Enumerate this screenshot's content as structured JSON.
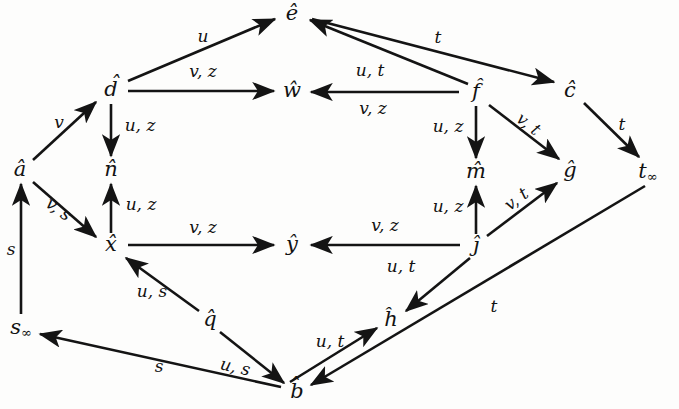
{
  "diagram": {
    "kind": "directed-graph",
    "title": "",
    "width": 679,
    "height": 409,
    "background_color": "#fdfdfc",
    "ink_color": "#141414",
    "nodes": [
      {
        "id": "e",
        "label": "ê",
        "base": "e",
        "accent": "hat",
        "sub": "",
        "x": 292,
        "y": 14
      },
      {
        "id": "d",
        "label": "d̂",
        "base": "d",
        "accent": "hat",
        "sub": "",
        "x": 111,
        "y": 90
      },
      {
        "id": "w",
        "label": "ŵ",
        "base": "w",
        "accent": "hat",
        "sub": "",
        "x": 292,
        "y": 91
      },
      {
        "id": "f",
        "label": "f̂",
        "base": "f",
        "accent": "hat",
        "sub": "",
        "x": 476,
        "y": 92
      },
      {
        "id": "c",
        "label": "ĉ",
        "base": "c",
        "accent": "hat",
        "sub": "",
        "x": 570,
        "y": 91
      },
      {
        "id": "a",
        "label": "â",
        "base": "a",
        "accent": "hat",
        "sub": "",
        "x": 20,
        "y": 170
      },
      {
        "id": "n",
        "label": "n̂",
        "base": "n",
        "accent": "hat",
        "sub": "",
        "x": 111,
        "y": 170
      },
      {
        "id": "m",
        "label": "m̂",
        "base": "m",
        "accent": "hat",
        "sub": "",
        "x": 476,
        "y": 172
      },
      {
        "id": "g",
        "label": "ĝ",
        "base": "g",
        "accent": "hat",
        "sub": "",
        "x": 570,
        "y": 171
      },
      {
        "id": "tinf",
        "label": "t∞",
        "base": "t",
        "accent": "none",
        "sub": "∞",
        "x": 648,
        "y": 172
      },
      {
        "id": "x",
        "label": "x̂",
        "base": "x",
        "accent": "hat",
        "sub": "",
        "x": 111,
        "y": 245
      },
      {
        "id": "y",
        "label": "ŷ",
        "base": "y",
        "accent": "hat",
        "sub": "",
        "x": 292,
        "y": 245
      },
      {
        "id": "j",
        "label": "ĵ",
        "base": "j",
        "accent": "hat",
        "sub": "",
        "x": 476,
        "y": 246
      },
      {
        "id": "q",
        "label": "q̂",
        "base": "q",
        "accent": "hat",
        "sub": "",
        "x": 210,
        "y": 320
      },
      {
        "id": "h",
        "label": "ĥ",
        "base": "h",
        "accent": "hat",
        "sub": "",
        "x": 391,
        "y": 320
      },
      {
        "id": "sinf",
        "label": "s∞",
        "base": "s",
        "accent": "none",
        "sub": "∞",
        "x": 21,
        "y": 328
      },
      {
        "id": "b",
        "label": "b̂",
        "base": "b",
        "accent": "hat",
        "sub": "",
        "x": 297,
        "y": 392
      }
    ],
    "edges": [
      {
        "id": "d-e",
        "from": "d",
        "to": "e",
        "label": "u",
        "lx": 203,
        "ly": 37
      },
      {
        "id": "d-w",
        "from": "d",
        "to": "w",
        "label": "v, z",
        "lx": 203,
        "ly": 72
      },
      {
        "id": "d-n",
        "from": "d",
        "to": "n",
        "label": "u, z",
        "lx": 140,
        "ly": 126
      },
      {
        "id": "a-d",
        "from": "a",
        "to": "d",
        "label": "v",
        "lx": 59,
        "ly": 123
      },
      {
        "id": "a-x",
        "from": "a",
        "to": "x",
        "label": "v, s",
        "lx": 58,
        "ly": 210
      },
      {
        "id": "sinf-a",
        "from": "sinf",
        "to": "a",
        "label": "s",
        "lx": 11,
        "ly": 250
      },
      {
        "id": "x-n",
        "from": "x",
        "to": "n",
        "label": "u, z",
        "lx": 141,
        "ly": 205
      },
      {
        "id": "x-y",
        "from": "x",
        "to": "y",
        "label": "v, z",
        "lx": 203,
        "ly": 228
      },
      {
        "id": "f-e",
        "from": "f",
        "to": "e",
        "label": "u, t",
        "lx": 370,
        "ly": 71
      },
      {
        "id": "f-w",
        "from": "f",
        "to": "w",
        "label": "v, z",
        "lx": 373,
        "ly": 108
      },
      {
        "id": "f-c",
        "from": "f",
        "to": "c",
        "label": "t",
        "lx": 438,
        "ly": 38
      },
      {
        "id": "f-m",
        "from": "f",
        "to": "m",
        "label": "u, z",
        "lx": 448,
        "ly": 127
      },
      {
        "id": "f-g",
        "from": "f",
        "to": "g",
        "label": "v, t",
        "lx": 528,
        "ly": 125
      },
      {
        "id": "c-tinf",
        "from": "c",
        "to": "tinf",
        "label": "t",
        "lx": 622,
        "ly": 125
      },
      {
        "id": "j-y",
        "from": "j",
        "to": "y",
        "label": "v, z",
        "lx": 385,
        "ly": 226
      },
      {
        "id": "j-y2",
        "from": "j",
        "to": "y",
        "label": "u, t",
        "lx": 401,
        "ly": 267
      },
      {
        "id": "j-m",
        "from": "j",
        "to": "m",
        "label": "u, z",
        "lx": 448,
        "ly": 207
      },
      {
        "id": "j-g",
        "from": "j",
        "to": "g",
        "label": "v, t",
        "lx": 517,
        "ly": 200
      },
      {
        "id": "j-h",
        "from": "j",
        "to": "h",
        "label": "",
        "lx": 0,
        "ly": 0
      },
      {
        "id": "q-x",
        "from": "q",
        "to": "x",
        "label": "u, s",
        "lx": 152,
        "ly": 292
      },
      {
        "id": "q-b",
        "from": "q",
        "to": "b",
        "label": "u, s",
        "lx": 235,
        "ly": 368
      },
      {
        "id": "b-sinf",
        "from": "b",
        "to": "sinf",
        "label": "s",
        "lx": 159,
        "ly": 367
      },
      {
        "id": "b-h",
        "from": "b",
        "to": "h",
        "label": "u, t",
        "lx": 330,
        "ly": 342
      },
      {
        "id": "tinf-b",
        "from": "tinf",
        "to": "b",
        "label": "t",
        "lx": 494,
        "ly": 307
      }
    ],
    "alphabet": [
      "u",
      "v",
      "z",
      "s",
      "t"
    ]
  }
}
